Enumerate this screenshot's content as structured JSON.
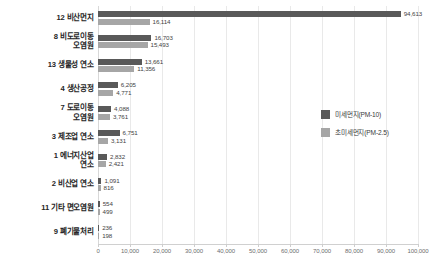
{
  "chart_data": {
    "type": "bar",
    "orientation": "horizontal",
    "title": "",
    "xlabel": "",
    "ylabel": "",
    "xlim": [
      0,
      100000
    ],
    "xticks": [
      "0",
      "10,000",
      "20,000",
      "30,000",
      "40,000",
      "50,000",
      "60,000",
      "70,000",
      "80,000",
      "90,000",
      "100,000"
    ],
    "grid": true,
    "legend_position": "right-middle",
    "categories": [
      "12 비산먼지",
      "8 비도로이동\n오염원",
      "13 생물성 연소",
      "4 생산공정",
      "7 도로이동\n오염원",
      "3 제조업 연소",
      "1 에너지산업\n연소",
      "2 비산업 연소",
      "11 기타 면오염원",
      "9 폐기물처리"
    ],
    "series": [
      {
        "name": "미세먼지(PM-10)",
        "color": "#595959",
        "values": [
          94613,
          16703,
          13661,
          6205,
          4088,
          6751,
          2832,
          1091,
          554,
          236
        ],
        "labels": [
          "94,613",
          "16,703",
          "13,661",
          "6,205",
          "4,088",
          "6,751",
          "2,832",
          "1,091",
          "554",
          "236"
        ]
      },
      {
        "name": "초미세먼지(PM-2.5)",
        "color": "#a6a6a6",
        "values": [
          16114,
          15493,
          11356,
          4771,
          3761,
          3131,
          2421,
          816,
          499,
          198
        ],
        "labels": [
          "16,114",
          "15,493",
          "11,356",
          "4,771",
          "3,761",
          "3,131",
          "2,421",
          "816",
          "499",
          "198"
        ]
      }
    ]
  },
  "legend": {
    "items": [
      {
        "label": "미세먼지(PM-10)",
        "color": "#595959"
      },
      {
        "label": "초미세먼지(PM-2.5)",
        "color": "#a6a6a6"
      }
    ]
  },
  "colors": {
    "pm10": "#595959",
    "pm25": "#a6a6a6",
    "gridline": "#e9e9e9",
    "axis": "#d0d0d0",
    "background": "#ffffff"
  }
}
